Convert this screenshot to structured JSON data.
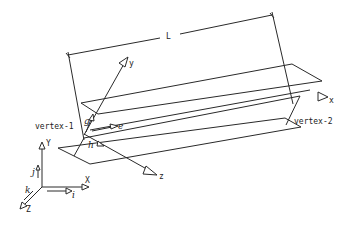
{
  "figure": {
    "type": "diagram",
    "dimension_label": "L",
    "vertex_labels": [
      "vertex-1",
      "vertex-2"
    ],
    "local_axes": {
      "x": "x",
      "y": "y",
      "z": "z"
    },
    "local_unit_vectors": {
      "e": "e",
      "g": "g",
      "h": "h"
    },
    "global_axes": {
      "X": "X",
      "Y": "Y",
      "Z": "Z"
    },
    "global_unit_vectors": {
      "i": "i",
      "j": "j",
      "k": "k"
    },
    "stroke_color": "#2a2a2a",
    "background_color": "#ffffff"
  }
}
